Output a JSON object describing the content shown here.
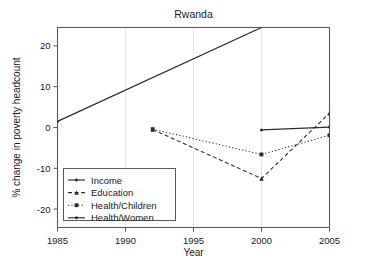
{
  "chart_data": {
    "type": "line",
    "title": "Rwanda",
    "xlabel": "Year",
    "ylabel": "% change in poverty headcount",
    "xlim": [
      1985,
      2005
    ],
    "ylim": [
      -24.5,
      24.5
    ],
    "xticks": [
      1985,
      1990,
      1995,
      2000,
      2005
    ],
    "xticklabels": [
      "1985",
      "1990",
      "1995",
      "2000",
      "2005"
    ],
    "yticks": [
      20,
      10,
      0,
      -10,
      -20
    ],
    "yticklabels": [
      "20",
      "10",
      "0",
      "-10",
      "-20"
    ],
    "grid": "vertical-only",
    "legend_position": "lower-left-inside",
    "series": [
      {
        "name": "Income",
        "linestyle": "solid",
        "marker": "dot",
        "x": [
          1985,
          2000
        ],
        "values": [
          1.5,
          24.5
        ],
        "clipped_at_top": true
      },
      {
        "name": "Education",
        "linestyle": "dashed",
        "marker": "triangle",
        "x": [
          1992,
          2000,
          2005
        ],
        "values": [
          -0.5,
          -12.5,
          3.5
        ]
      },
      {
        "name": "Health/Children",
        "linestyle": "dotted",
        "marker": "square",
        "x": [
          1992,
          2000,
          2005
        ],
        "values": [
          -0.4,
          -6.6,
          -1.9
        ]
      },
      {
        "name": "Health/Women",
        "linestyle": "solid",
        "marker": "dot",
        "x": [
          2000,
          2005
        ],
        "values": [
          -0.6,
          0.1
        ]
      }
    ]
  },
  "legend": {
    "entries": [
      {
        "label": "Income"
      },
      {
        "label": "Education"
      },
      {
        "label": "Health/Children"
      },
      {
        "label": "Health/Women"
      }
    ]
  },
  "colors": {
    "line": "#2b2b2b",
    "frame": "#5a5a5a",
    "grid": "#e2e2e8",
    "background": "#ffffff",
    "text": "#1a1a1a"
  }
}
